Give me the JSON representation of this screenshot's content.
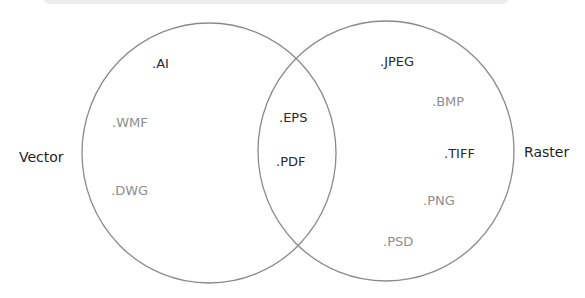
{
  "diagram": {
    "type": "venn",
    "sets": [
      {
        "name": "Vector",
        "items": [
          ".AI",
          ".WMF",
          ".DWG"
        ]
      },
      {
        "name": "Raster",
        "items": [
          ".JPEG",
          ".BMP",
          ".TIFF",
          ".PNG",
          ".PSD"
        ]
      }
    ],
    "intersection": [
      ".EPS",
      ".PDF"
    ],
    "colors": {
      "circle_stroke": "#8a8a8a",
      "dark_text": "#2a2a2a",
      "light_text": "#8e8e8e"
    }
  },
  "labels": {
    "vector": "Vector",
    "raster": "Raster",
    "ai": ".AI",
    "wmf": ".WMF",
    "dwg": ".DWG",
    "eps": ".EPS",
    "pdf": ".PDF",
    "jpeg": ".JPEG",
    "bmp": ".BMP",
    "tiff": ".TIFF",
    "png": ".PNG",
    "psd": ".PSD"
  }
}
